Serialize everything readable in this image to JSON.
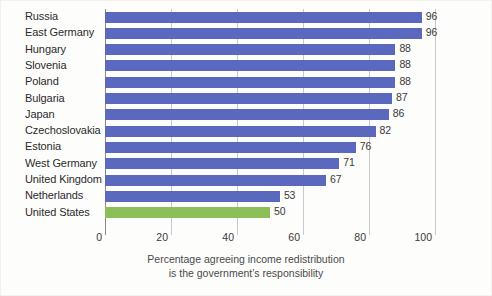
{
  "chart_data": {
    "type": "bar",
    "orientation": "horizontal",
    "title": "",
    "subtitle": "",
    "xlabel_line1": "Percentage agreeing income redistribution",
    "xlabel_line2": "is the government’s responsibility",
    "ylabel": "",
    "xlim": [
      0,
      100
    ],
    "grid": true,
    "legend": "none",
    "categories": [
      "Russia",
      "East Germany",
      "Hungary",
      "Slovenia",
      "Poland",
      "Bulgaria",
      "Japan",
      "Czechoslovakia",
      "Estonia",
      "West Germany",
      "United Kingdom",
      "Netherlands",
      "United States"
    ],
    "values": [
      96,
      96,
      88,
      88,
      88,
      87,
      86,
      82,
      76,
      71,
      67,
      53,
      50
    ],
    "value_labels": [
      "96",
      "96",
      "88",
      "88",
      "88",
      "87",
      "86",
      "82",
      "76",
      "71",
      "67",
      "53",
      "50"
    ],
    "bar_colors": [
      "#5a68bd",
      "#5a68bd",
      "#5a68bd",
      "#5a68bd",
      "#5a68bd",
      "#5a68bd",
      "#5a68bd",
      "#5a68bd",
      "#5a68bd",
      "#5a68bd",
      "#5a68bd",
      "#5a68bd",
      "#8dbf58"
    ],
    "highlighted_category": "United States",
    "xticks": [
      0,
      20,
      40,
      60,
      80,
      100
    ],
    "xtick_labels": [
      "0",
      "20",
      "40",
      "60",
      "80",
      "100"
    ],
    "colors": {
      "bar_default": "#5a68bd",
      "bar_highlight": "#8dbf58",
      "gridline": "#c9c9c9",
      "axis": "#8a8a8a",
      "text": "#2b2b2b",
      "background": "#fdfdfc"
    }
  }
}
